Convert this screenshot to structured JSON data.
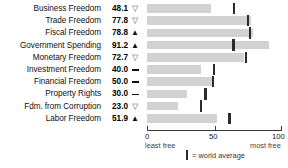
{
  "chart_data": {
    "type": "bar",
    "title": "",
    "xlabel": "",
    "ylabel": "",
    "xlim": [
      0,
      100
    ],
    "grid": false,
    "orientation": "horizontal",
    "legend_position": "bottom",
    "categories": [
      "Business Freedom",
      "Trade Freedom",
      "Fiscal Freedom",
      "Government Spending",
      "Monetary Freedom",
      "Investment Freedom",
      "Financial Freedom",
      "Property Rights",
      "Fdm. from Corruption",
      "Labor Freedom"
    ],
    "values": [
      48.1,
      77.8,
      78.8,
      91.2,
      72.7,
      40.0,
      50.0,
      30.0,
      23.0,
      51.9
    ],
    "value_labels": [
      "48.1",
      "77.8",
      "78.8",
      "91.2",
      "72.7",
      "40.0",
      "50.0",
      "30.0",
      "23.0",
      "51.9"
    ],
    "trend_indicators": [
      "down",
      "down",
      "up",
      "up",
      "down",
      "flat",
      "flat",
      "flat",
      "down",
      "up"
    ],
    "series": [
      {
        "name": "score",
        "values": [
          48.1,
          77.8,
          78.8,
          91.2,
          72.7,
          40.0,
          50.0,
          30.0,
          23.0,
          51.9
        ]
      },
      {
        "name": "world average",
        "values": [
          65.0,
          75.2,
          76.5,
          64.5,
          73.8,
          50.0,
          49.0,
          43.6,
          40.5,
          61.5
        ]
      }
    ],
    "xticks": [
      0,
      50,
      100
    ],
    "xtick_labels": [
      "0",
      "50",
      "100"
    ],
    "axis_captions": {
      "left": "least free",
      "right": "most free"
    },
    "legend": {
      "marker": "world-average-tick",
      "label": "= world average"
    },
    "colors": {
      "bar": "#d2d2d2",
      "average_marker": "#2b2b2b",
      "axis": "#3a3a3a",
      "text": "#111111"
    }
  }
}
